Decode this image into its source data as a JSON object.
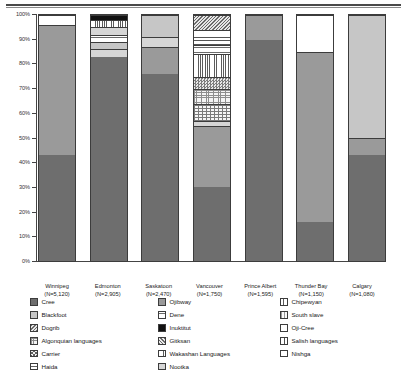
{
  "chart_data": {
    "type": "bar",
    "subtype": "100% stacked bar",
    "title": "",
    "xlabel": "",
    "ylabel": "",
    "ylim": [
      0,
      100
    ],
    "ytick_labels": [
      "100%",
      "90%",
      "80%",
      "70%",
      "60%",
      "50%",
      "40%",
      "30%",
      "20%",
      "10%",
      "0%"
    ],
    "ytick_values": [
      100,
      90,
      80,
      70,
      60,
      50,
      40,
      30,
      20,
      10,
      0
    ],
    "grid": false,
    "legend_position": "bottom",
    "categories": [
      "Winnipeg",
      "Edmonton",
      "Saskatoon",
      "Vancouver",
      "Prince Albert",
      "Thunder Bay",
      "Calgary"
    ],
    "category_counts": [
      "(N=5,120)",
      "(N=2,905)",
      "(N=2,470)",
      "(N=1,750)",
      "(N=1,595)",
      "(N=1,150)",
      "(N=1,080)"
    ],
    "series": [
      {
        "name": "Cree",
        "values": [
          43,
          83,
          76,
          30,
          90,
          16,
          43
        ]
      },
      {
        "name": "Ojibway",
        "values": [
          53,
          0,
          11,
          25,
          10,
          69,
          7
        ]
      },
      {
        "name": "Blackfoot",
        "values": [
          0,
          0,
          0,
          0,
          0,
          0,
          50
        ]
      },
      {
        "name": "Nootka",
        "values": [
          0,
          0,
          0,
          2,
          0,
          0,
          0
        ]
      },
      {
        "name": "Algonquian languages",
        "values": [
          0,
          0,
          0,
          7,
          0,
          0,
          0
        ]
      },
      {
        "name": "Carrier",
        "values": [
          0,
          0,
          0,
          6,
          0,
          0,
          0
        ]
      },
      {
        "name": "Gitksan",
        "values": [
          0,
          0,
          0,
          7,
          0,
          0,
          0
        ]
      },
      {
        "name": "Wakashan Languages",
        "values": [
          0,
          0,
          0,
          9,
          0,
          0,
          0
        ]
      },
      {
        "name": "Salish languages",
        "values": [
          0,
          0,
          0,
          4,
          0,
          0,
          0
        ]
      },
      {
        "name": "Nishga",
        "values": [
          0,
          0,
          0,
          6,
          0,
          0,
          0
        ]
      },
      {
        "name": "Haida",
        "values": [
          0,
          3,
          0,
          0,
          0,
          0,
          0
        ]
      },
      {
        "name": "Dene",
        "values": [
          0,
          5,
          0,
          0,
          0,
          0,
          0
        ]
      },
      {
        "name": "Chipewyan",
        "values": [
          0,
          4,
          0,
          0,
          0,
          0,
          0
        ]
      },
      {
        "name": "Inuktitut",
        "values": [
          0,
          2,
          0,
          0,
          0,
          0,
          0
        ]
      },
      {
        "name": "Dogrib",
        "values": [
          0,
          0,
          0,
          0,
          0,
          0,
          0
        ]
      },
      {
        "name": "South slave",
        "values": [
          0,
          0,
          5,
          0,
          0,
          0,
          0
        ]
      },
      {
        "name": "Oji-Cree",
        "values": [
          4,
          3,
          8,
          4,
          0,
          15,
          0
        ]
      }
    ]
  },
  "axis": {
    "ticks": [
      {
        "label": "100%"
      },
      {
        "label": "90%"
      },
      {
        "label": "80%"
      },
      {
        "label": "70%"
      },
      {
        "label": "60%"
      },
      {
        "label": "50%"
      },
      {
        "label": "40%"
      },
      {
        "label": "30%"
      },
      {
        "label": "20%"
      },
      {
        "label": "10%"
      },
      {
        "label": "0%"
      }
    ]
  },
  "xaxis": {
    "items": [
      {
        "city": "Winnipeg",
        "n": "(N=5,120)"
      },
      {
        "city": "Edmonton",
        "n": "(N=2,905)"
      },
      {
        "city": "Saskatoon",
        "n": "(N=2,470)"
      },
      {
        "city": "Vancouver",
        "n": "(N=1,750)"
      },
      {
        "city": "Prince Albert",
        "n": "(N=1,595)"
      },
      {
        "city": "Thunder Bay",
        "n": "(N=1,150)"
      },
      {
        "city": "Calgary",
        "n": "(N=1,080)"
      }
    ]
  },
  "legend": {
    "col1": [
      {
        "label": "Cree",
        "swatch": "f-cree"
      },
      {
        "label": "Blackfoot",
        "swatch": "f-blackfoot"
      },
      {
        "label": "Dogrib",
        "swatch": "f-dogrib"
      },
      {
        "label": "Algonquian languages",
        "swatch": "f-algonquian"
      },
      {
        "label": "Carrier",
        "swatch": "f-carrier"
      },
      {
        "label": "Haida",
        "swatch": "f-haida"
      }
    ],
    "col2": [
      {
        "label": "Ojibway",
        "swatch": "f-ojibway"
      },
      {
        "label": "Dene",
        "swatch": "f-dene"
      },
      {
        "label": "Inuktitut",
        "swatch": "f-inuktitut"
      },
      {
        "label": "Gitksan",
        "swatch": "f-gitksan"
      },
      {
        "label": "Wakashan Languages",
        "swatch": "f-wakashan"
      },
      {
        "label": "Nootka",
        "swatch": "f-nootka"
      }
    ],
    "col3": [
      {
        "label": "Chipewyan",
        "swatch": "f-chipewyan"
      },
      {
        "label": "South slave",
        "swatch": "f-southslave"
      },
      {
        "label": "Oji-Cree",
        "swatch": "f-ojicree"
      },
      {
        "label": "Salish languages",
        "swatch": "f-salish"
      },
      {
        "label": "Nishga",
        "swatch": "f-nishga"
      }
    ]
  },
  "bars": {
    "winnipeg": [
      {
        "name": "Cree",
        "pct": 43,
        "fill": "f-cree"
      },
      {
        "name": "Ojibway",
        "pct": 53,
        "fill": "f-ojibway"
      },
      {
        "name": "Oji-Cree",
        "pct": 4,
        "fill": "f-ojicree"
      }
    ],
    "edmonton": [
      {
        "name": "Cree",
        "pct": 83,
        "fill": "f-cree"
      },
      {
        "name": "Nootka",
        "pct": 3,
        "fill": "f-nootka"
      },
      {
        "name": "Chipewyan",
        "pct": 3,
        "fill": "f-blackfoot"
      },
      {
        "name": "Dene",
        "pct": 3,
        "fill": "f-dene"
      },
      {
        "name": "Haida",
        "pct": 3,
        "fill": "f-nootka"
      },
      {
        "name": "Wakashan Languages",
        "pct": 3,
        "fill": "f-wakashan"
      },
      {
        "name": "Inuktitut",
        "pct": 2,
        "fill": "f-inuktitut"
      }
    ],
    "saskatoon": [
      {
        "name": "Cree",
        "pct": 76,
        "fill": "f-cree"
      },
      {
        "name": "Ojibway",
        "pct": 11,
        "fill": "f-ojibway"
      },
      {
        "name": "South slave",
        "pct": 4,
        "fill": "f-nootka"
      },
      {
        "name": "Oji-Cree",
        "pct": 9,
        "fill": "f-blackfoot"
      }
    ],
    "vancouver": [
      {
        "name": "Cree",
        "pct": 30,
        "fill": "f-cree"
      },
      {
        "name": "Ojibway",
        "pct": 25,
        "fill": "f-ojibway"
      },
      {
        "name": "Nootka",
        "pct": 2,
        "fill": "f-nootka"
      },
      {
        "name": "Algonquian languages",
        "pct": 7,
        "fill": "f-brick"
      },
      {
        "name": "Carrier",
        "pct": 6,
        "fill": "f-algonquian"
      },
      {
        "name": "Gitksan",
        "pct": 5,
        "fill": "f-checker"
      },
      {
        "name": "Wakashan Languages",
        "pct": 9,
        "fill": "f-wakashan"
      },
      {
        "name": "Salish languages",
        "pct": 4,
        "fill": "f-dene"
      },
      {
        "name": "Nishga",
        "pct": 6,
        "fill": "f-nishga"
      },
      {
        "name": "Oji-Cree",
        "pct": 6,
        "fill": "f-dogrib"
      }
    ],
    "prince_albert": [
      {
        "name": "Cree",
        "pct": 90,
        "fill": "f-cree"
      },
      {
        "name": "Ojibway",
        "pct": 10,
        "fill": "f-ojibway"
      }
    ],
    "thunder_bay": [
      {
        "name": "Cree",
        "pct": 16,
        "fill": "f-cree"
      },
      {
        "name": "Ojibway",
        "pct": 69,
        "fill": "f-ojibway"
      },
      {
        "name": "Oji-Cree",
        "pct": 15,
        "fill": "f-ojicree"
      }
    ],
    "calgary": [
      {
        "name": "Cree",
        "pct": 43,
        "fill": "f-cree"
      },
      {
        "name": "Ojibway",
        "pct": 7,
        "fill": "f-ojibway"
      },
      {
        "name": "Blackfoot",
        "pct": 50,
        "fill": "f-blackfoot"
      }
    ]
  }
}
